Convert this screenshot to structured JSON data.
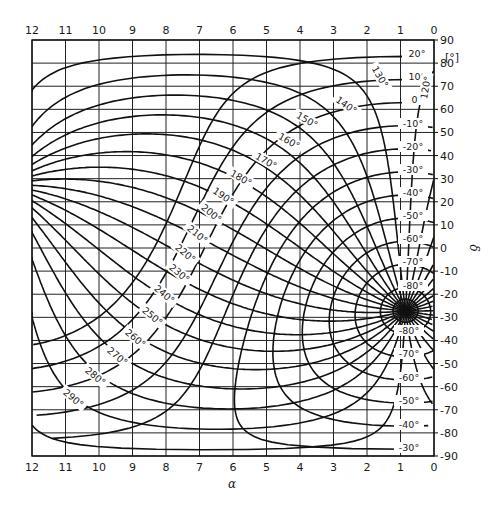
{
  "chart_data": {
    "type": "coordinate-conversion-diagram",
    "title": "",
    "xlabel": "α",
    "ylabel": "δ",
    "y_unit": "[°]",
    "x_ticks": [
      "12",
      "11",
      "10",
      "9",
      "8",
      "7",
      "6",
      "5",
      "4",
      "3",
      "2",
      "1",
      "0"
    ],
    "x_range": [
      12,
      0
    ],
    "y_ticks": [
      "90",
      "80",
      "70",
      "60",
      "50",
      "40",
      "30",
      "20",
      "10",
      "0",
      "-10",
      "-20",
      "-30",
      "-40",
      "-50",
      "-60",
      "-70",
      "-80",
      "-90"
    ],
    "y_range": [
      90,
      -90
    ],
    "grid": true,
    "pole": {
      "alpha_h": 0.85,
      "delta_deg": -27.1
    },
    "latitude_curves_labels": [
      "20°",
      "10°",
      "0°",
      "-10°",
      "-20°",
      "-30°",
      "-40°",
      "-50°",
      "-60°",
      "-70°",
      "-80°",
      "-80°",
      "-70°",
      "-60°",
      "-50°",
      "-40°",
      "-30°"
    ],
    "latitude_values": [
      20,
      10,
      0,
      -10,
      -20,
      -30,
      -40,
      -50,
      -60,
      -70,
      -80
    ],
    "longitude_labels": [
      "120°",
      "130°",
      "140°",
      "150°",
      "160°",
      "170°",
      "180°",
      "190°",
      "200°",
      "210°",
      "220°",
      "230°",
      "240°",
      "250°",
      "260°",
      "270°",
      "280°",
      "290°"
    ],
    "longitude_values": [
      120,
      130,
      140,
      150,
      160,
      170,
      180,
      190,
      200,
      210,
      220,
      230,
      240,
      250,
      260,
      270,
      280,
      290
    ]
  },
  "frame": {
    "left": 32,
    "right": 434,
    "top": 40,
    "bottom": 456
  },
  "colors": {
    "line": "#111111",
    "grid": "#222222",
    "background": "#ffffff"
  }
}
